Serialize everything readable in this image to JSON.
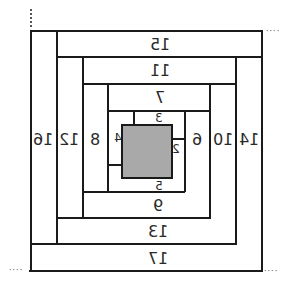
{
  "diagram": {
    "type": "log-cabin-quilt-block",
    "mirrored": true,
    "center_fill": "#a9a9a9",
    "labels": {
      "l1": "1",
      "l2": "2",
      "l3": "3",
      "l4": "4",
      "l5": "5",
      "l6": "6",
      "l7": "7",
      "l8": "8",
      "l9": "9",
      "l10": "10",
      "l11": "11",
      "l12": "12",
      "l13": "13",
      "l14": "14",
      "l15": "15",
      "l16": "16",
      "l17": "17"
    },
    "dots": "····"
  }
}
